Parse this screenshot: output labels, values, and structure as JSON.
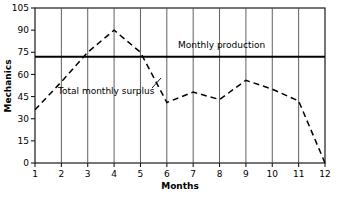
{
  "chart_data": {
    "type": "line",
    "title": "",
    "xlabel": "Months",
    "ylabel": "Mechanics",
    "xlim": [
      1,
      12
    ],
    "ylim": [
      0,
      105
    ],
    "grid": "vertical",
    "legend_position": "inline-annotation",
    "x": [
      1,
      2,
      3,
      4,
      5,
      6,
      7,
      8,
      9,
      10,
      11,
      12
    ],
    "xticks": [
      "1",
      "2",
      "3",
      "4",
      "5",
      "6",
      "7",
      "8",
      "9",
      "10",
      "11",
      "12"
    ],
    "yticks": [
      "0",
      "15",
      "30",
      "45",
      "60",
      "75",
      "90",
      "105"
    ],
    "ytick_values": [
      0,
      15,
      30,
      45,
      60,
      75,
      90,
      105
    ],
    "series": [
      {
        "name": "Total monthly surplus",
        "style": "dashed",
        "color": "#000000",
        "values": [
          36,
          55,
          75,
          90,
          75,
          41,
          48,
          43,
          56,
          50,
          42,
          0
        ]
      },
      {
        "name": "Monthly production",
        "style": "solid",
        "color": "#000000",
        "constant": 72
      }
    ],
    "annotations": [
      {
        "text": "Monthly production",
        "x": 7.0,
        "y": 78
      },
      {
        "text": "Total monthly surplus",
        "x": 2.5,
        "y": 50
      }
    ]
  },
  "labels": {
    "y_axis_title": "Mechanics",
    "x_axis_title": "Months",
    "production_label": "Monthly production",
    "surplus_label": "Total monthly surplus"
  },
  "colors": {
    "line": "#000000",
    "frame": "#1a1a1a",
    "grid": "#4d4d4d",
    "background": "#ffffff"
  }
}
